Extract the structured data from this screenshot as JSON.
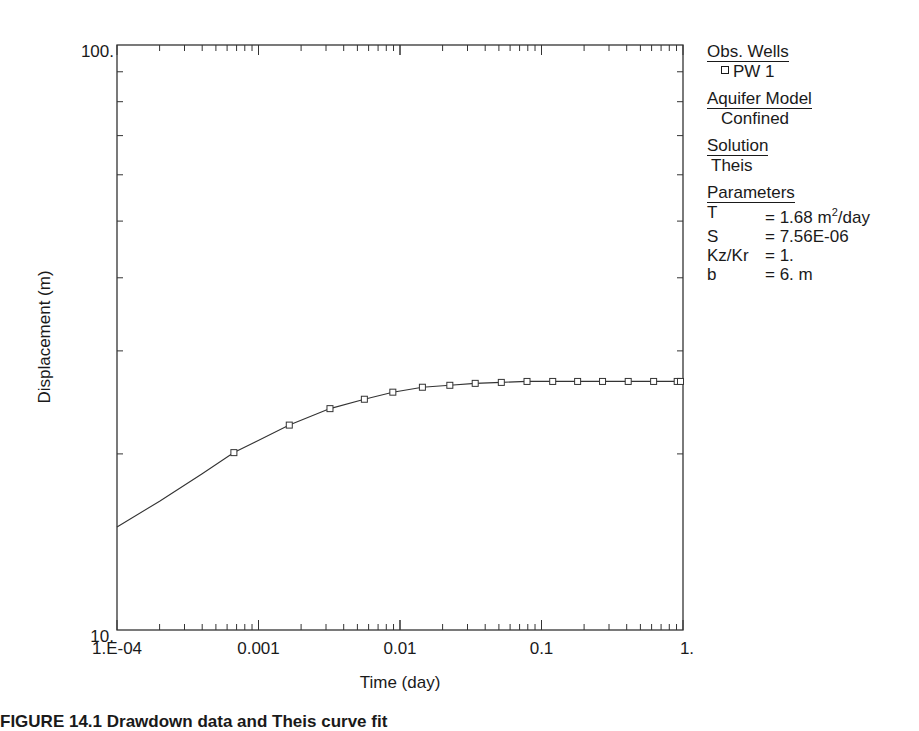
{
  "chart_data": {
    "type": "scatter",
    "title": "",
    "xlabel": "Time (day)",
    "ylabel": "Displacement (m)",
    "xscale": "log",
    "yscale": "log",
    "xlim": [
      0.0001,
      1
    ],
    "ylim": [
      10,
      100
    ],
    "x_tick_labels": [
      "1.E-04",
      "0.001",
      "0.01",
      "0.1",
      "1."
    ],
    "y_tick_labels": [
      "10.",
      "100."
    ],
    "grid": false,
    "legend_position": "right",
    "series": [
      {
        "name": "PW 1",
        "kind": "observed",
        "marker": "square",
        "x": [
          0.00067,
          0.00165,
          0.0032,
          0.0056,
          0.0089,
          0.0144,
          0.0225,
          0.034,
          0.052,
          0.079,
          0.12,
          0.18,
          0.27,
          0.41,
          0.62,
          0.91,
          0.96
        ],
        "y": [
          20.1,
          22.4,
          23.9,
          24.8,
          25.5,
          26.0,
          26.2,
          26.4,
          26.5,
          26.6,
          26.6,
          26.6,
          26.6,
          26.6,
          26.6,
          26.6,
          26.6
        ]
      },
      {
        "name": "Theis fit",
        "kind": "model-curve",
        "x": [
          0.0001,
          0.0002,
          0.0004,
          0.00067,
          0.00165,
          0.0032,
          0.0056,
          0.0089,
          0.0144,
          0.0225,
          0.034,
          0.052,
          0.079,
          0.12,
          0.3,
          1.0
        ],
        "y": [
          15.0,
          16.6,
          18.5,
          20.1,
          22.4,
          23.9,
          24.8,
          25.5,
          26.0,
          26.2,
          26.4,
          26.5,
          26.6,
          26.6,
          26.6,
          26.6
        ]
      }
    ]
  },
  "legend": {
    "obs_wells_title": "Obs. Wells",
    "obs_well": "PW 1",
    "aquifer_title": "Aquifer Model",
    "aquifer_value": "Confined",
    "solution_title": "Solution",
    "solution_value": "Theis",
    "parameters_title": "Parameters",
    "parameters": [
      {
        "key": "T",
        "value": "= 1.68 m",
        "sup": "2",
        "suffix": "/day"
      },
      {
        "key": "S",
        "value": "= 7.56E-06",
        "sup": "",
        "suffix": ""
      },
      {
        "key": "Kz/Kr",
        "value": "= 1.",
        "sup": "",
        "suffix": ""
      },
      {
        "key": "b",
        "value": "= 6. m",
        "sup": "",
        "suffix": ""
      }
    ]
  },
  "caption": "FIGURE 14.1  Drawdown data and Theis curve fit"
}
